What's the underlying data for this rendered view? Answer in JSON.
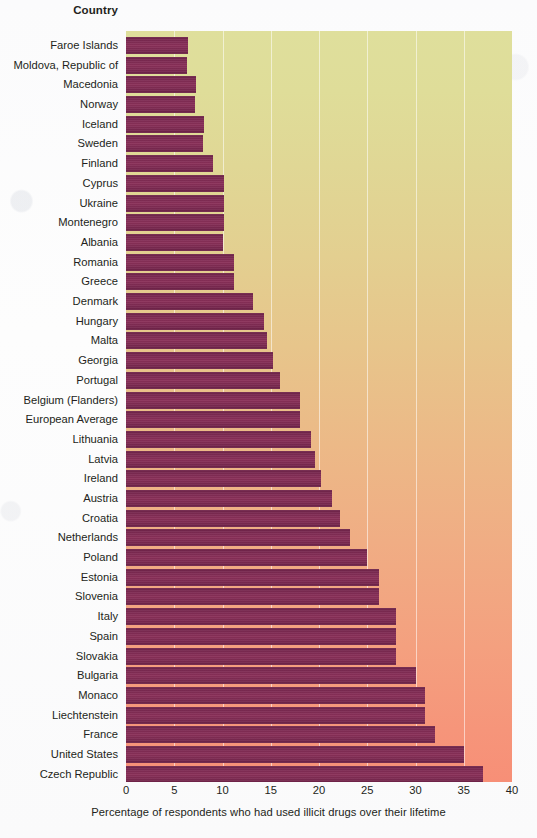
{
  "header": {
    "country_label": "Country"
  },
  "axis": {
    "ticks": [
      "0",
      "5",
      "10",
      "15",
      "20",
      "25",
      "30",
      "35",
      "40"
    ],
    "xlabel": "Percentage of respondents who had used illicit drugs over their lifetime"
  },
  "colors": {
    "bar": "#7d2a52",
    "plot_top": "#dfdf9c",
    "plot_bottom": "#f78f77",
    "gridline": "#ffffff",
    "text": "#231f20"
  },
  "chart_data": {
    "type": "bar",
    "orientation": "horizontal",
    "title": "",
    "xlabel": "Percentage of respondents who had used illicit drugs over their lifetime",
    "ylabel": "Country",
    "xlim": [
      0,
      40
    ],
    "xticks": [
      0,
      5,
      10,
      15,
      20,
      25,
      30,
      35,
      40
    ],
    "grid": true,
    "legend": "none",
    "categories": [
      "Faroe Islands",
      "Moldova, Republic of",
      "Macedonia",
      "Norway",
      "Iceland",
      "Sweden",
      "Finland",
      "Cyprus",
      "Ukraine",
      "Montenegro",
      "Albania",
      "Romania",
      "Greece",
      "Denmark",
      "Hungary",
      "Malta",
      "Georgia",
      "Portugal",
      "Belgium (Flanders)",
      "European Average",
      "Lithuania",
      "Latvia",
      "Ireland",
      "Austria",
      "Croatia",
      "Netherlands",
      "Poland",
      "Estonia",
      "Slovenia",
      "Italy",
      "Spain",
      "Slovakia",
      "Bulgaria",
      "Monaco",
      "Liechtenstein",
      "France",
      "United States",
      "Czech Republic"
    ],
    "values": [
      6.4,
      6.3,
      7.3,
      7.1,
      8.1,
      8.0,
      9.0,
      10.2,
      10.2,
      10.2,
      10.0,
      11.2,
      11.2,
      13.2,
      14.3,
      14.6,
      15.2,
      16.0,
      18.0,
      18.0,
      19.2,
      19.6,
      20.2,
      21.3,
      22.2,
      23.2,
      25.0,
      26.2,
      26.2,
      28.0,
      28.0,
      28.0,
      30.0,
      31.0,
      31.0,
      32.0,
      35.0,
      37.0
    ]
  }
}
